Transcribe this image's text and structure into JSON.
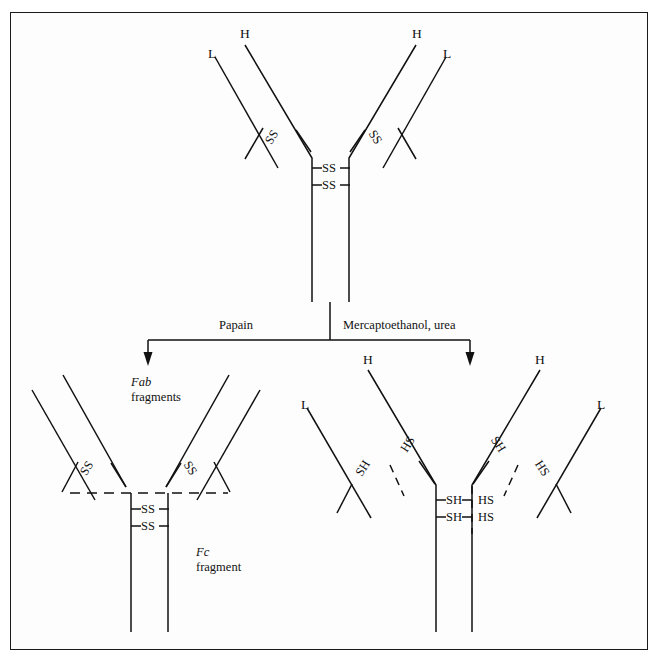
{
  "figure": {
    "background_color": "#fdfdfd",
    "frame_color": "#1a1a1a",
    "ink_color": "#111111",
    "title": "Antibody structure: papain cleavage and mercaptoethanol reduction"
  },
  "intact_antibody": {
    "name": "intact-immunoglobulin",
    "chain_labels": {
      "left_light": "L",
      "left_heavy": "H",
      "right_heavy": "H",
      "right_light": "L"
    },
    "arm_disulfides": {
      "left": "SS",
      "right": "SS"
    },
    "hinge_disulfides": [
      "SS",
      "SS"
    ]
  },
  "reactions": {
    "left": {
      "label": "Papain",
      "arrow": "down-arrow"
    },
    "right": {
      "label": "Mercaptoethanol, urea",
      "arrow": "down-arrow"
    }
  },
  "papain_products": {
    "fab": {
      "name_italic": "Fab",
      "name_rest": "fragments",
      "left_disulfide": "SS",
      "right_disulfide": "SS"
    },
    "fc": {
      "name_italic": "Fc",
      "name_rest": "fragment",
      "disulfides": [
        "SS",
        "SS"
      ]
    },
    "cleavage_line": "dashed-cleavage-line"
  },
  "reduced_products": {
    "chain_labels": {
      "far_left_light": "L",
      "left_heavy": "H",
      "right_heavy": "H",
      "far_right_light": "L"
    },
    "arm_thiols": {
      "left_heavy": "SH",
      "left_light": "HS",
      "right_heavy": "SH",
      "right_light": "HS"
    },
    "hinge_thiols": {
      "left": [
        "SH",
        "SH"
      ],
      "right": [
        "HS",
        "HS"
      ]
    },
    "separators": [
      "dashed-separator",
      "dashed-separator",
      "dashed-separator"
    ]
  }
}
